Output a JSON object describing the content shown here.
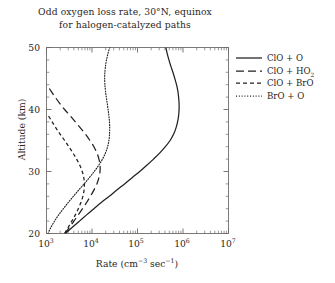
{
  "chart_data": {
    "type": "line",
    "title": "Odd oxygen loss rate, 30°N,  equinox",
    "subtitle": "for halogen-catalyzed paths",
    "xlabel_text": "Rate (cm",
    "xlabel_sup1": "−3",
    "xlabel_mid": " sec",
    "xlabel_sup2": "−1",
    "xlabel_end": ")",
    "ylabel": "Altitude (km)",
    "xscale": "log",
    "xlim": [
      1000,
      10000000
    ],
    "ylim": [
      20,
      50
    ],
    "grid": false,
    "legend_position": "right-outside",
    "xticks": [
      1000,
      10000,
      100000,
      1000000,
      10000000
    ],
    "xtick_labels": [
      "10",
      "10",
      "10",
      "10",
      "10"
    ],
    "xtick_exponents": [
      "3",
      "4",
      "5",
      "6",
      "7"
    ],
    "yticks": [
      20,
      30,
      40,
      50
    ],
    "ytick_labels": [
      "20",
      "30",
      "40",
      "50"
    ],
    "yticks_minor": [
      22,
      24,
      26,
      28,
      32,
      34,
      36,
      38,
      42,
      44,
      46,
      48
    ],
    "series": [
      {
        "name": "ClO + O",
        "style": "solid",
        "points": [
          [
            20,
            2600
          ],
          [
            21,
            3700
          ],
          [
            22,
            5300
          ],
          [
            23,
            7600
          ],
          [
            24,
            11000
          ],
          [
            25,
            16000
          ],
          [
            26,
            24000
          ],
          [
            27,
            35000
          ],
          [
            28,
            52000
          ],
          [
            29,
            76000
          ],
          [
            30,
            112000
          ],
          [
            31,
            160000
          ],
          [
            32,
            225000
          ],
          [
            33,
            310000
          ],
          [
            34,
            410000
          ],
          [
            35,
            520000
          ],
          [
            36,
            620000
          ],
          [
            37,
            700000
          ],
          [
            38,
            760000
          ],
          [
            39,
            800000
          ],
          [
            40,
            820000
          ],
          [
            41,
            820000
          ],
          [
            42,
            800000
          ],
          [
            43,
            770000
          ],
          [
            44,
            720000
          ],
          [
            45,
            660000
          ],
          [
            46,
            600000
          ],
          [
            47,
            540000
          ],
          [
            48,
            490000
          ],
          [
            49,
            450000
          ],
          [
            50,
            420000
          ]
        ]
      },
      {
        "name": "ClO + HO2",
        "style": "longdash",
        "points": [
          [
            20,
            2500
          ],
          [
            21,
            3200
          ],
          [
            22,
            4000
          ],
          [
            23,
            5000
          ],
          [
            24,
            6200
          ],
          [
            25,
            7600
          ],
          [
            26,
            9200
          ],
          [
            27,
            11000
          ],
          [
            28,
            12800
          ],
          [
            29,
            14200
          ],
          [
            30,
            15000
          ],
          [
            31,
            15000
          ],
          [
            32,
            14200
          ],
          [
            33,
            12800
          ],
          [
            34,
            11000
          ],
          [
            35,
            9000
          ],
          [
            36,
            7200
          ],
          [
            37,
            5600
          ],
          [
            38,
            4300
          ],
          [
            39,
            3300
          ],
          [
            40,
            2500
          ],
          [
            41,
            1950
          ],
          [
            42,
            1550
          ],
          [
            43,
            1250
          ],
          [
            43.5,
            1130
          ]
        ]
      },
      {
        "name": "ClO + BrO",
        "style": "shortdash",
        "points": [
          [
            20,
            2500
          ],
          [
            21,
            3000
          ],
          [
            22,
            3600
          ],
          [
            23,
            4300
          ],
          [
            24,
            5000
          ],
          [
            25,
            5700
          ],
          [
            26,
            6300
          ],
          [
            27,
            6700
          ],
          [
            28,
            6800
          ],
          [
            29,
            6600
          ],
          [
            30,
            6100
          ],
          [
            31,
            5400
          ],
          [
            32,
            4600
          ],
          [
            33,
            3800
          ],
          [
            34,
            3100
          ],
          [
            35,
            2500
          ],
          [
            36,
            2000
          ],
          [
            37,
            1620
          ],
          [
            38,
            1330
          ],
          [
            39,
            1100
          ]
        ]
      },
      {
        "name": "BrO + O",
        "style": "dotted",
        "points": [
          [
            20,
            1080
          ],
          [
            21,
            1250
          ],
          [
            22,
            1500
          ],
          [
            23,
            1850
          ],
          [
            24,
            2350
          ],
          [
            25,
            3000
          ],
          [
            26,
            3900
          ],
          [
            27,
            5100
          ],
          [
            28,
            6700
          ],
          [
            29,
            8700
          ],
          [
            30,
            11200
          ],
          [
            31,
            14000
          ],
          [
            32,
            17000
          ],
          [
            33,
            19800
          ],
          [
            34,
            22000
          ],
          [
            35,
            23500
          ],
          [
            36,
            24300
          ],
          [
            37,
            24500
          ],
          [
            38,
            24200
          ],
          [
            39,
            23500
          ],
          [
            40,
            22600
          ],
          [
            41,
            21600
          ],
          [
            42,
            20600
          ],
          [
            43,
            19800
          ],
          [
            44,
            19200
          ],
          [
            45,
            19000
          ],
          [
            46,
            19200
          ],
          [
            47,
            19800
          ],
          [
            48,
            20800
          ],
          [
            49,
            22400
          ],
          [
            50,
            24500
          ]
        ]
      }
    ],
    "legend": [
      {
        "label_main": "ClO + O",
        "label_sub": "",
        "label_tail": "",
        "style": "solid"
      },
      {
        "label_main": "ClO + HO",
        "label_sub": "2",
        "label_tail": "",
        "style": "longdash"
      },
      {
        "label_main": "ClO + BrO",
        "label_sub": "",
        "label_tail": "",
        "style": "shortdash"
      },
      {
        "label_main": "BrO + O",
        "label_sub": "",
        "label_tail": "",
        "style": "dotted"
      }
    ],
    "axis_color": "#6e6a68",
    "curve_color": "#231f20"
  }
}
